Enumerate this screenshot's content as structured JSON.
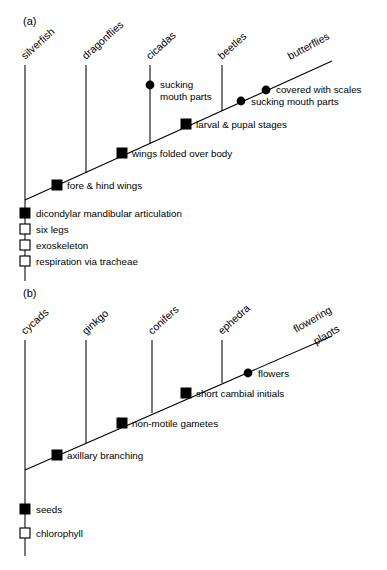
{
  "figure": {
    "background_color": "#ffffff",
    "ink_color": "#000000"
  },
  "panels": [
    {
      "id": "a",
      "letter": "(a)",
      "subject": "insects",
      "taxa": [
        {
          "label": "silverfish",
          "x": 25,
          "is_trunk": true
        },
        {
          "label": "dragonflies",
          "x": 86,
          "is_trunk": false
        },
        {
          "label": "cicadas",
          "x": 150,
          "is_trunk": false
        },
        {
          "label": "beetles",
          "x": 222,
          "is_trunk": false
        },
        {
          "label": "butterflies",
          "x": 330,
          "is_trunk": false
        }
      ],
      "trunk_traits": [
        {
          "label": "dicondylar mandibular articulation",
          "marker": "filled-square"
        },
        {
          "label": "six legs",
          "marker": "open-square"
        },
        {
          "label": "exoskeleton",
          "marker": "open-square"
        },
        {
          "label": "respiration via tracheae",
          "marker": "open-square"
        }
      ],
      "branch_traits": [
        {
          "label": "fore & hind wings",
          "marker": "filled-square"
        },
        {
          "label": "wings folded over body",
          "marker": "filled-square"
        },
        {
          "label": "larval & pupal stages",
          "marker": "filled-square"
        },
        {
          "label": "sucking mouth parts",
          "marker": "filled-circle",
          "on_taxon": "beetles-butterflies"
        },
        {
          "label": "covered with scales",
          "marker": "filled-circle",
          "on_taxon": "butterflies"
        }
      ],
      "terminal_traits": [
        {
          "label": "sucking\nmouth parts",
          "line1": "sucking",
          "line2": "mouth parts",
          "marker": "filled-circle",
          "on_taxon": "cicadas"
        }
      ]
    },
    {
      "id": "b",
      "letter": "(b)",
      "subject": "seed plants",
      "taxa": [
        {
          "label": "cycads",
          "x": 25,
          "is_trunk": true
        },
        {
          "label": "ginkgo",
          "x": 86,
          "is_trunk": false
        },
        {
          "label": "conifers",
          "x": 152,
          "is_trunk": false
        },
        {
          "label": "ephedra",
          "x": 222,
          "is_trunk": false
        },
        {
          "label": "flowering plants",
          "line1": "flowering",
          "line2": "plants",
          "x": 330,
          "is_trunk": false
        }
      ],
      "trunk_traits": [
        {
          "label": "seeds",
          "marker": "filled-square"
        },
        {
          "label": "chlorophyll",
          "marker": "open-square"
        }
      ],
      "branch_traits": [
        {
          "label": "axillary branching",
          "marker": "filled-square"
        },
        {
          "label": "non-motile gametes",
          "marker": "filled-square"
        },
        {
          "label": "short cambial initials",
          "marker": "filled-square"
        },
        {
          "label": "flowers",
          "marker": "filled-circle"
        }
      ]
    }
  ]
}
